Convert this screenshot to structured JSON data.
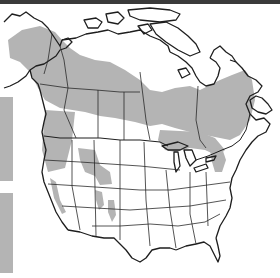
{
  "map": {
    "subject": "species range map of North America",
    "region": "North America (Canada, United States)",
    "legend": {
      "swatches": [
        {
          "label": "",
          "color": "#b4b4b4"
        },
        {
          "label": "",
          "color": "#b4b4b4"
        }
      ]
    },
    "colors": {
      "range_fill": "#b4b4b4",
      "land": "#ffffff",
      "outline": "#1e1e1e",
      "top_bar": "#3a3a3a"
    }
  }
}
